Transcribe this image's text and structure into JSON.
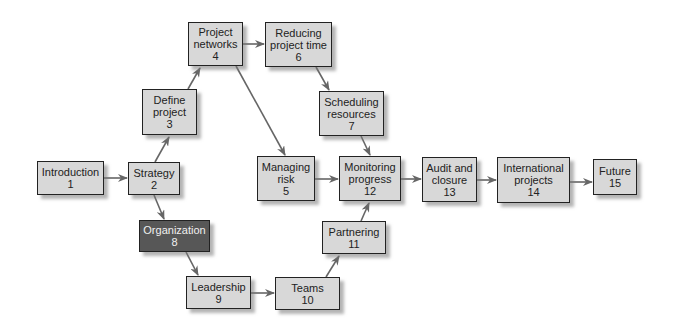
{
  "diagram": {
    "nodes": [
      {
        "id": 1,
        "lines": [
          "Introduction",
          "1"
        ],
        "x": 37,
        "y": 161,
        "w": 67,
        "h": 34,
        "style": "light"
      },
      {
        "id": 2,
        "lines": [
          "Strategy",
          "2"
        ],
        "x": 128,
        "y": 162,
        "w": 52,
        "h": 33,
        "style": "light"
      },
      {
        "id": 3,
        "lines": [
          "Define",
          "project",
          "3"
        ],
        "x": 142,
        "y": 89,
        "w": 55,
        "h": 46,
        "style": "light"
      },
      {
        "id": 4,
        "lines": [
          "Project",
          "networks",
          "4"
        ],
        "x": 188,
        "y": 22,
        "w": 55,
        "h": 44,
        "style": "light"
      },
      {
        "id": 5,
        "lines": [
          "Managing",
          "risk",
          "5"
        ],
        "x": 257,
        "y": 156,
        "w": 58,
        "h": 45,
        "style": "light"
      },
      {
        "id": 6,
        "lines": [
          "Reducing",
          "project time",
          "6"
        ],
        "x": 265,
        "y": 22,
        "w": 67,
        "h": 45,
        "style": "light"
      },
      {
        "id": 7,
        "lines": [
          "Scheduling",
          "resources",
          "7"
        ],
        "x": 319,
        "y": 91,
        "w": 65,
        "h": 45,
        "style": "light"
      },
      {
        "id": 8,
        "lines": [
          "Organization",
          "8"
        ],
        "x": 139,
        "y": 220,
        "w": 71,
        "h": 32,
        "style": "dark"
      },
      {
        "id": 9,
        "lines": [
          "Leadership",
          "9"
        ],
        "x": 186,
        "y": 276,
        "w": 65,
        "h": 33,
        "style": "light"
      },
      {
        "id": 10,
        "lines": [
          "Teams",
          "10"
        ],
        "x": 275,
        "y": 277,
        "w": 65,
        "h": 33,
        "style": "light"
      },
      {
        "id": 11,
        "lines": [
          "Partnering",
          "11"
        ],
        "x": 322,
        "y": 221,
        "w": 64,
        "h": 33,
        "style": "light"
      },
      {
        "id": 12,
        "lines": [
          "Monitoring",
          "progress",
          "12"
        ],
        "x": 339,
        "y": 156,
        "w": 62,
        "h": 45,
        "style": "light"
      },
      {
        "id": 13,
        "lines": [
          "Audit and",
          "closure",
          "13"
        ],
        "x": 422,
        "y": 157,
        "w": 55,
        "h": 45,
        "style": "light"
      },
      {
        "id": 14,
        "lines": [
          "International",
          "projects",
          "14"
        ],
        "x": 497,
        "y": 157,
        "w": 73,
        "h": 46,
        "style": "light"
      },
      {
        "id": 15,
        "lines": [
          "Future",
          "15"
        ],
        "x": 593,
        "y": 159,
        "w": 44,
        "h": 36,
        "style": "light"
      }
    ],
    "edges": [
      {
        "from": 1,
        "to": 2,
        "x1": 104,
        "y1": 178,
        "x2": 127,
        "y2": 178
      },
      {
        "from": 2,
        "to": 3,
        "x1": 155,
        "y1": 162,
        "x2": 169,
        "y2": 137
      },
      {
        "from": 3,
        "to": 4,
        "x1": 188,
        "y1": 89,
        "x2": 200,
        "y2": 68
      },
      {
        "from": 4,
        "to": 6,
        "x1": 243,
        "y1": 44,
        "x2": 264,
        "y2": 44
      },
      {
        "from": 4,
        "to": 5,
        "x1": 236,
        "y1": 66,
        "x2": 285,
        "y2": 155
      },
      {
        "from": 6,
        "to": 7,
        "x1": 316,
        "y1": 67,
        "x2": 329,
        "y2": 90
      },
      {
        "from": 7,
        "to": 12,
        "x1": 361,
        "y1": 136,
        "x2": 370,
        "y2": 155
      },
      {
        "from": 5,
        "to": 12,
        "x1": 315,
        "y1": 179,
        "x2": 338,
        "y2": 179
      },
      {
        "from": 2,
        "to": 8,
        "x1": 154,
        "y1": 195,
        "x2": 164,
        "y2": 219
      },
      {
        "from": 8,
        "to": 9,
        "x1": 186,
        "y1": 252,
        "x2": 198,
        "y2": 275
      },
      {
        "from": 9,
        "to": 10,
        "x1": 251,
        "y1": 293,
        "x2": 274,
        "y2": 293
      },
      {
        "from": 10,
        "to": 11,
        "x1": 326,
        "y1": 277,
        "x2": 339,
        "y2": 256
      },
      {
        "from": 11,
        "to": 12,
        "x1": 361,
        "y1": 221,
        "x2": 369,
        "y2": 203
      },
      {
        "from": 12,
        "to": 13,
        "x1": 401,
        "y1": 179,
        "x2": 421,
        "y2": 179
      },
      {
        "from": 13,
        "to": 14,
        "x1": 477,
        "y1": 180,
        "x2": 496,
        "y2": 180
      },
      {
        "from": 14,
        "to": 15,
        "x1": 570,
        "y1": 182,
        "x2": 592,
        "y2": 182
      }
    ],
    "colors": {
      "node_fill": "#d8d8d8",
      "node_border": "#222222",
      "highlight_fill": "#575757",
      "arrow": "#666666"
    }
  }
}
